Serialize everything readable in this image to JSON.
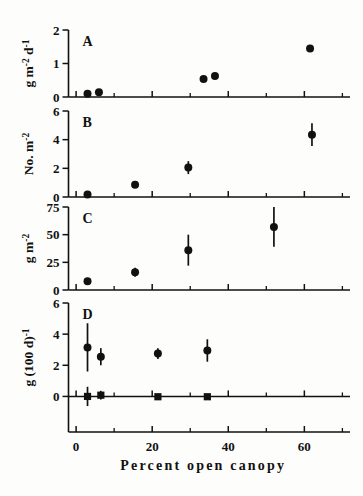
{
  "figure": {
    "background": "#fdfdfb",
    "ink": "#111111",
    "xlabel": "Percent open canopy",
    "xticks": [
      0,
      20,
      40,
      60
    ],
    "xtick_labels": [
      "0",
      "20",
      "40",
      "60"
    ],
    "xminor": [
      10,
      30,
      50,
      70
    ],
    "xlim": [
      -2,
      72
    ]
  },
  "chart_data": [
    {
      "type": "scatter",
      "panel": "A",
      "title": "",
      "ylabel": "g m-2 d-1",
      "ylabel_parts": {
        "base1": "g m",
        "sup1": "-2",
        "base2": " d",
        "sup2": "-1"
      },
      "xlabel": "Percent open canopy",
      "xlim": [
        -2,
        72
      ],
      "ylim": [
        0,
        2
      ],
      "yticks": [
        0,
        1,
        2
      ],
      "ytick_labels": [
        "0",
        "1",
        "2"
      ],
      "grid": false,
      "legend": "none",
      "marker": "filled-circle",
      "points": [
        {
          "x": 3.0,
          "y": 0.1,
          "err": 0.0
        },
        {
          "x": 6.0,
          "y": 0.14,
          "err": 0.0
        },
        {
          "x": 33.5,
          "y": 0.54,
          "err": 0.0
        },
        {
          "x": 36.5,
          "y": 0.63,
          "err": 0.0
        },
        {
          "x": 61.5,
          "y": 1.45,
          "err": 0.0
        }
      ]
    },
    {
      "type": "scatter",
      "panel": "B",
      "title": "",
      "ylabel": "No. m-2",
      "ylabel_parts": {
        "base1": "No. m",
        "sup1": "-2",
        "base2": "",
        "sup2": ""
      },
      "xlabel": "Percent open canopy",
      "xlim": [
        -2,
        72
      ],
      "ylim": [
        0,
        6
      ],
      "yticks": [
        0,
        2,
        4,
        6
      ],
      "ytick_labels": [
        "0",
        "2",
        "4",
        "6"
      ],
      "grid": false,
      "legend": "none",
      "marker": "filled-circle",
      "points": [
        {
          "x": 3.0,
          "y": 0.18,
          "err": 0.0
        },
        {
          "x": 15.5,
          "y": 0.85,
          "err": 0.0
        },
        {
          "x": 29.5,
          "y": 2.05,
          "err": 0.45
        },
        {
          "x": 62.0,
          "y": 4.35,
          "err": 0.8
        }
      ]
    },
    {
      "type": "scatter",
      "panel": "C",
      "title": "",
      "ylabel": "g m-2",
      "ylabel_parts": {
        "base1": "g m",
        "sup1": "-2",
        "base2": "",
        "sup2": ""
      },
      "xlabel": "Percent open canopy",
      "xlim": [
        -2,
        72
      ],
      "ylim": [
        0,
        75
      ],
      "yticks": [
        0,
        25,
        50,
        75
      ],
      "ytick_labels": [
        "0",
        "25",
        "50",
        "75"
      ],
      "grid": false,
      "legend": "none",
      "marker": "filled-circle",
      "points": [
        {
          "x": 3.0,
          "y": 8.0,
          "err": 2.5
        },
        {
          "x": 15.5,
          "y": 16.0,
          "err": 4.0
        },
        {
          "x": 29.5,
          "y": 36.0,
          "err": 14.0
        },
        {
          "x": 52.0,
          "y": 57.0,
          "err": 18.0
        }
      ]
    },
    {
      "type": "scatter",
      "panel": "D",
      "title": "",
      "ylabel": "g (100 d)-1",
      "ylabel_parts": {
        "base1": "g (100 d)",
        "sup1": "-1",
        "base2": "",
        "sup2": ""
      },
      "xlabel": "Percent open canopy",
      "xlim": [
        -2,
        72
      ],
      "ylim": [
        -1,
        6
      ],
      "yticks": [
        0,
        2,
        4,
        6
      ],
      "ytick_labels": [
        "0",
        "2",
        "4",
        "6"
      ],
      "grid": false,
      "legend": "none",
      "series": [
        {
          "name": "upper",
          "marker": "filled-circle",
          "points": [
            {
              "x": 3.0,
              "y": 3.15,
              "err": 1.55
            },
            {
              "x": 6.5,
              "y": 2.55,
              "err": 0.55
            },
            {
              "x": 21.5,
              "y": 2.75,
              "err": 0.35
            },
            {
              "x": 34.5,
              "y": 2.95,
              "err": 0.72
            }
          ]
        },
        {
          "name": "lower",
          "marker": "filled-square",
          "points": [
            {
              "x": 3.0,
              "y": 0.0,
              "err": 0.62
            },
            {
              "x": 6.5,
              "y": 0.08,
              "err": 0.28
            },
            {
              "x": 21.5,
              "y": -0.02,
              "err": 0.18
            },
            {
              "x": 34.5,
              "y": -0.02,
              "err": 0.18
            }
          ]
        }
      ]
    }
  ]
}
